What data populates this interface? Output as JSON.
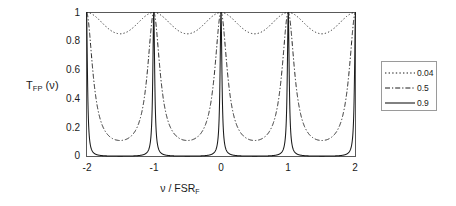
{
  "figure": {
    "background_color": "#ffffff",
    "axis_color": "#4d4d4d",
    "curve_color": "#1a1a1a"
  },
  "axes": {
    "y_title_main": "T",
    "y_title_sub": "FP",
    "y_title_tail": " (ν)",
    "x_title_main": "ν / FSR",
    "x_title_sub": "F",
    "y_ticks": [
      "0",
      "0.2",
      "0.4",
      "0.6",
      "0.8",
      "1"
    ],
    "x_ticks": [
      "-2",
      "-1",
      "0",
      "1",
      "2"
    ]
  },
  "legend": {
    "entries": [
      {
        "label": "0.04",
        "style": "dotted"
      },
      {
        "label": "0.5",
        "style": "dashdot"
      },
      {
        "label": "0.9",
        "style": "solid"
      }
    ]
  },
  "chart_data": {
    "type": "line",
    "title": "",
    "xlabel": "ν / FSR_F",
    "ylabel": "T_FP(ν)",
    "xlim": [
      -2,
      2
    ],
    "ylim": [
      0,
      1
    ],
    "grid": false,
    "legend_position": "right-outside",
    "x_ticks": [
      -2,
      -1,
      0,
      1,
      2
    ],
    "y_ticks": [
      0,
      0.2,
      0.4,
      0.6,
      0.8,
      1
    ],
    "annotation": "Fabry-Perot Airy transmission function for three mirror reflectivities; peaks at integer multiples of the free spectral range.",
    "formula": "T_FP(v) = 1 / (1 + F*sin^2(pi*v)), F = 4R/(1-R)^2",
    "series": [
      {
        "name": "0.04",
        "reflectivity": 0.04,
        "style": "dotted",
        "finesse_coefficient": 0.1736,
        "minimum_value": 0.852,
        "maximum_value": 1.0,
        "x": [
          -2,
          -1.9,
          -1.8,
          -1.7,
          -1.6,
          -1.5,
          -1.4,
          -1.3,
          -1.2,
          -1.1,
          -1,
          -0.9,
          -0.8,
          -0.7,
          -0.6,
          -0.5,
          -0.4,
          -0.3,
          -0.2,
          -0.1,
          0,
          0.1,
          0.2,
          0.3,
          0.4,
          0.5,
          0.6,
          0.7,
          0.8,
          0.9,
          1,
          1.1,
          1.2,
          1.3,
          1.4,
          1.5,
          1.6,
          1.7,
          1.8,
          1.9,
          2
        ],
        "values": [
          1.0,
          0.984,
          0.944,
          0.895,
          0.862,
          0.852,
          0.862,
          0.895,
          0.944,
          0.984,
          1.0,
          0.984,
          0.944,
          0.895,
          0.862,
          0.852,
          0.862,
          0.895,
          0.944,
          0.984,
          1.0,
          0.984,
          0.944,
          0.895,
          0.862,
          0.852,
          0.862,
          0.895,
          0.944,
          0.984,
          1.0,
          0.984,
          0.944,
          0.895,
          0.862,
          0.852,
          0.862,
          0.895,
          0.944,
          0.984,
          1.0
        ]
      },
      {
        "name": "0.5",
        "reflectivity": 0.5,
        "style": "dashdot",
        "finesse_coefficient": 8.0,
        "minimum_value": 0.111,
        "maximum_value": 1.0,
        "x": [
          -2,
          -1.9,
          -1.8,
          -1.7,
          -1.6,
          -1.5,
          -1.4,
          -1.3,
          -1.2,
          -1.1,
          -1,
          -0.9,
          -0.8,
          -0.7,
          -0.6,
          -0.5,
          -0.4,
          -0.3,
          -0.2,
          -0.1,
          0,
          0.1,
          0.2,
          0.3,
          0.4,
          0.5,
          0.6,
          0.7,
          0.8,
          0.9,
          1,
          1.1,
          1.2,
          1.3,
          1.4,
          1.5,
          1.6,
          1.7,
          1.8,
          1.9,
          2
        ],
        "values": [
          1.0,
          0.563,
          0.247,
          0.157,
          0.121,
          0.111,
          0.121,
          0.157,
          0.247,
          0.563,
          1.0,
          0.563,
          0.247,
          0.157,
          0.121,
          0.111,
          0.121,
          0.157,
          0.247,
          0.563,
          1.0,
          0.563,
          0.247,
          0.157,
          0.121,
          0.111,
          0.121,
          0.157,
          0.247,
          0.563,
          1.0,
          0.563,
          0.247,
          0.157,
          0.121,
          0.111,
          0.121,
          0.157,
          0.247,
          0.563,
          1.0
        ]
      },
      {
        "name": "0.9",
        "reflectivity": 0.9,
        "style": "solid",
        "finesse_coefficient": 360.0,
        "minimum_value": 0.0028,
        "maximum_value": 1.0,
        "x": [
          -2,
          -1.9,
          -1.8,
          -1.7,
          -1.6,
          -1.5,
          -1.4,
          -1.3,
          -1.2,
          -1.1,
          -1,
          -0.9,
          -0.8,
          -0.7,
          -0.6,
          -0.5,
          -0.4,
          -0.3,
          -0.2,
          -0.1,
          0,
          0.1,
          0.2,
          0.3,
          0.4,
          0.5,
          0.6,
          0.7,
          0.8,
          0.9,
          1,
          1.1,
          1.2,
          1.3,
          1.4,
          1.5,
          1.6,
          1.7,
          1.8,
          1.9,
          2
        ],
        "values": [
          1.0,
          0.028,
          0.0078,
          0.0038,
          0.0029,
          0.0028,
          0.0029,
          0.0038,
          0.0078,
          0.028,
          1.0,
          0.028,
          0.0078,
          0.0038,
          0.0029,
          0.0028,
          0.0029,
          0.0038,
          0.0078,
          0.028,
          1.0,
          0.028,
          0.0078,
          0.0038,
          0.0029,
          0.0028,
          0.0029,
          0.0038,
          0.0078,
          0.028,
          1.0,
          0.028,
          0.0078,
          0.0038,
          0.0029,
          0.0028,
          0.0029,
          0.0038,
          0.0078,
          0.028,
          1.0
        ]
      }
    ]
  }
}
